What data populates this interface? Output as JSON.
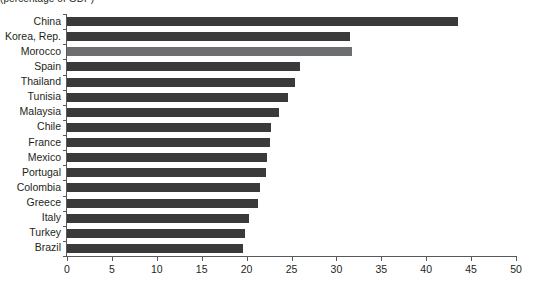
{
  "subtitle": "(percentage of GDP)",
  "colors": {
    "bar": "#3a3a3a",
    "bar_highlight": "#6d6e70",
    "axis": "#58595b",
    "text": "#231f20",
    "background": "#ffffff"
  },
  "chart_data": {
    "type": "bar",
    "orientation": "horizontal",
    "title": "",
    "subtitle": "(percentage of GDP)",
    "xlabel": "",
    "ylabel": "",
    "xlim": [
      0,
      50
    ],
    "xticks": [
      0,
      5,
      10,
      15,
      20,
      25,
      30,
      35,
      40,
      45,
      50
    ],
    "grid": false,
    "legend": "none",
    "highlight_category": "Morocco",
    "categories": [
      "China",
      "Korea, Rep.",
      "Morocco",
      "Spain",
      "Thailand",
      "Tunisia",
      "Malaysia",
      "Chile",
      "France",
      "Mexico",
      "Portugal",
      "Colombia",
      "Greece",
      "Italy",
      "Turkey",
      "Brazil"
    ],
    "values": [
      43.5,
      31.5,
      31.7,
      26.0,
      25.4,
      24.6,
      23.6,
      22.7,
      22.6,
      22.3,
      22.2,
      21.5,
      21.3,
      20.3,
      19.8,
      19.6
    ]
  }
}
